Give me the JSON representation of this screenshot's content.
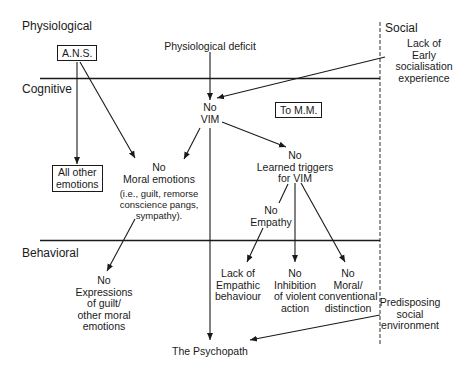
{
  "domains": {
    "physiological": "Physiological",
    "cognitive": "Cognitive",
    "behavioral": "Behavioral",
    "social": "Social"
  },
  "nodes": {
    "ans": "A.N.S.",
    "physiological_deficit": "Physiological deficit",
    "lack_early_socialisation": [
      "Lack of",
      "Early",
      "socialisation",
      "experience"
    ],
    "no_vim": [
      "No",
      "VIM"
    ],
    "to_mm": "To M.M.",
    "all_other_emotions": [
      "All other",
      "emotions"
    ],
    "no_moral_emotions": [
      "No",
      "Moral emotions"
    ],
    "moral_emotions_examples": [
      "(i.e., guilt, remorse",
      "conscience pangs,",
      "sympathy)."
    ],
    "no_learned_triggers": [
      "No",
      "Learned triggers",
      "for VIM"
    ],
    "no_empathy": [
      "No",
      "Empathy"
    ],
    "no_expressions_guilt": [
      "No",
      "Expressions",
      "of guilt/",
      "other moral",
      "emotions"
    ],
    "lack_empathic_behaviour": [
      "Lack of",
      "Empathic",
      "behaviour"
    ],
    "no_inhibition_violent": [
      "No",
      "Inhibition",
      "of violent",
      "action"
    ],
    "no_moral_conventional": [
      "No",
      "Moral/",
      "conventional",
      "distinction"
    ],
    "predisposing_social_env": [
      "Predisposing",
      "social",
      "environment"
    ],
    "psychopath": "The Psychopath"
  },
  "edges": [
    {
      "from": "physiological_deficit",
      "to": "no_vim"
    },
    {
      "from": "lack_early_socialisation",
      "to": "no_vim"
    },
    {
      "from": "ans",
      "to": "all_other_emotions"
    },
    {
      "from": "ans",
      "to": "no_moral_emotions"
    },
    {
      "from": "no_vim",
      "to": "no_moral_emotions"
    },
    {
      "from": "no_vim",
      "to": "no_learned_triggers"
    },
    {
      "from": "no_vim",
      "to": "psychopath"
    },
    {
      "from": "no_learned_triggers",
      "to": "no_empathy"
    },
    {
      "from": "no_empathy",
      "to": "lack_empathic_behaviour"
    },
    {
      "from": "no_learned_triggers",
      "to": "no_inhibition_violent"
    },
    {
      "from": "no_learned_triggers",
      "to": "no_moral_conventional"
    },
    {
      "from": "no_moral_emotions",
      "to": "no_expressions_guilt"
    },
    {
      "from": "predisposing_social_env",
      "to": "psychopath"
    }
  ]
}
